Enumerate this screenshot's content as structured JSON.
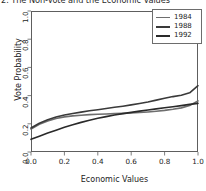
{
  "chart_data": {
    "type": "line",
    "title": "2. The Non-Vote and the Economic Values",
    "xlabel": "Economic Values",
    "ylabel": "Vote Probability",
    "xlim": [
      0.0,
      1.0
    ],
    "ylim": [
      0.0,
      1.0
    ],
    "grid": false,
    "legend_position": "top-right",
    "xticks": [
      "0.0",
      "0.2",
      "0.4",
      "0.6",
      "0.8",
      "1.0"
    ],
    "xtick_values": [
      0.0,
      0.2,
      0.4,
      0.6,
      0.8,
      1.0
    ],
    "yticks": [
      "0.0",
      "0.2",
      "0.4",
      "0.6",
      "0.8",
      "1.0"
    ],
    "ytick_values": [
      0.0,
      0.2,
      0.4,
      0.6,
      0.8,
      1.0
    ],
    "x": [
      0.0,
      0.05,
      0.1,
      0.15,
      0.2,
      0.25,
      0.3,
      0.35,
      0.4,
      0.45,
      0.5,
      0.55,
      0.6,
      0.65,
      0.7,
      0.75,
      0.8,
      0.85,
      0.9,
      0.95,
      1.0
    ],
    "series": [
      {
        "name": "1984",
        "color": "#6e6e6e",
        "values": [
          0.163,
          0.196,
          0.22,
          0.237,
          0.249,
          0.256,
          0.261,
          0.265,
          0.268,
          0.27,
          0.272,
          0.274,
          0.277,
          0.28,
          0.284,
          0.289,
          0.295,
          0.303,
          0.313,
          0.33,
          0.362
        ]
      },
      {
        "name": "1988",
        "color": "#3a3a3a",
        "values": [
          0.17,
          0.204,
          0.229,
          0.248,
          0.262,
          0.273,
          0.283,
          0.292,
          0.3,
          0.309,
          0.317,
          0.325,
          0.334,
          0.344,
          0.355,
          0.368,
          0.381,
          0.393,
          0.403,
          0.42,
          0.47
        ]
      },
      {
        "name": "1992",
        "color": "#2a2a2a",
        "values": [
          0.09,
          0.112,
          0.134,
          0.155,
          0.175,
          0.193,
          0.21,
          0.225,
          0.239,
          0.251,
          0.262,
          0.272,
          0.281,
          0.29,
          0.298,
          0.306,
          0.314,
          0.321,
          0.329,
          0.338,
          0.345
        ]
      }
    ]
  },
  "legend": {
    "entries": [
      {
        "label": "1984"
      },
      {
        "label": "1988"
      },
      {
        "label": "1992"
      }
    ]
  },
  "axes": {
    "x_tick_labels": [
      "0.0",
      "0.2",
      "0.4",
      "0.6",
      "0.8",
      "1.0"
    ],
    "y_tick_labels": [
      "0.0",
      "0.2",
      "0.4",
      "0.6",
      "0.8",
      "1.0"
    ]
  },
  "colors": {
    "frame": "#5e5e5e",
    "text": "#232323",
    "background": "#ffffff"
  }
}
